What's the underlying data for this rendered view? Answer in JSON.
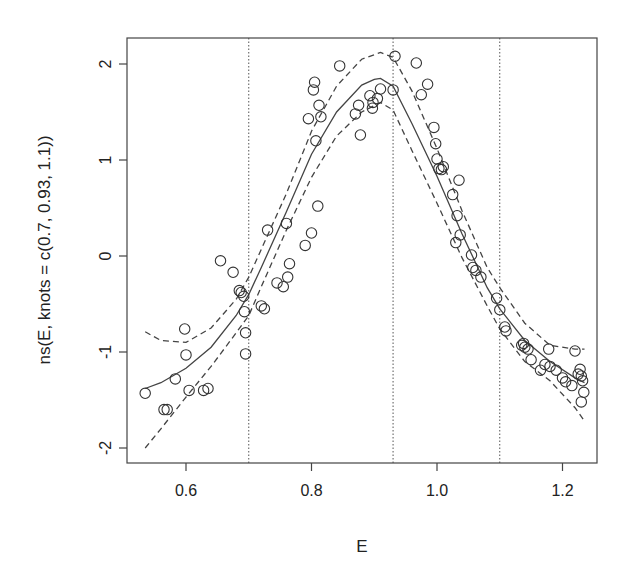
{
  "chart_data": {
    "type": "scatter",
    "title": "",
    "xlabel": "E",
    "ylabel": "ns(E, knots = c(0.7, 0.93, 1.1))",
    "xlim": [
      0.53,
      1.25
    ],
    "ylim": [
      -2.15,
      2.25
    ],
    "x_ticks": [
      0.6,
      0.8,
      1.0,
      1.2
    ],
    "x_tick_labels": [
      "0.6",
      "0.8",
      "1.0",
      "1.2"
    ],
    "y_ticks": [
      -2,
      -1,
      0,
      1,
      2
    ],
    "y_tick_labels": [
      "-2",
      "-1",
      "0",
      "1",
      "2"
    ],
    "grid": false,
    "legend": null,
    "knots": [
      0.7,
      0.93,
      1.1
    ],
    "series": [
      {
        "name": "partial residuals",
        "style": "open-circle",
        "points": [
          [
            0.535,
            -1.43
          ],
          [
            0.565,
            -1.6
          ],
          [
            0.57,
            -1.6
          ],
          [
            0.583,
            -1.28
          ],
          [
            0.598,
            -0.76
          ],
          [
            0.6,
            -1.03
          ],
          [
            0.605,
            -1.4
          ],
          [
            0.628,
            -1.4
          ],
          [
            0.635,
            -1.38
          ],
          [
            0.655,
            -0.05
          ],
          [
            0.675,
            -0.17
          ],
          [
            0.685,
            -0.36
          ],
          [
            0.688,
            -0.38
          ],
          [
            0.692,
            -0.42
          ],
          [
            0.693,
            -0.58
          ],
          [
            0.695,
            -0.8
          ],
          [
            0.695,
            -1.02
          ],
          [
            0.72,
            -0.52
          ],
          [
            0.725,
            -0.55
          ],
          [
            0.73,
            0.27
          ],
          [
            0.745,
            -0.28
          ],
          [
            0.755,
            -0.32
          ],
          [
            0.76,
            0.34
          ],
          [
            0.762,
            -0.22
          ],
          [
            0.765,
            -0.08
          ],
          [
            0.79,
            0.11
          ],
          [
            0.795,
            1.43
          ],
          [
            0.8,
            0.24
          ],
          [
            0.803,
            1.73
          ],
          [
            0.805,
            1.81
          ],
          [
            0.807,
            1.2
          ],
          [
            0.81,
            0.52
          ],
          [
            0.812,
            1.57
          ],
          [
            0.815,
            1.45
          ],
          [
            0.845,
            1.98
          ],
          [
            0.87,
            1.48
          ],
          [
            0.875,
            1.57
          ],
          [
            0.878,
            1.26
          ],
          [
            0.893,
            1.67
          ],
          [
            0.897,
            1.54
          ],
          [
            0.898,
            1.6
          ],
          [
            0.905,
            1.64
          ],
          [
            0.91,
            1.74
          ],
          [
            0.93,
            1.73
          ],
          [
            0.933,
            2.08
          ],
          [
            0.967,
            2.01
          ],
          [
            0.975,
            1.68
          ],
          [
            0.985,
            1.79
          ],
          [
            0.995,
            1.34
          ],
          [
            0.998,
            1.17
          ],
          [
            1.0,
            1.01
          ],
          [
            1.003,
            0.91
          ],
          [
            1.007,
            0.9
          ],
          [
            1.01,
            0.93
          ],
          [
            1.025,
            0.64
          ],
          [
            1.03,
            0.14
          ],
          [
            1.032,
            0.42
          ],
          [
            1.035,
            0.79
          ],
          [
            1.037,
            0.22
          ],
          [
            1.055,
            0.01
          ],
          [
            1.057,
            -0.12
          ],
          [
            1.062,
            -0.15
          ],
          [
            1.07,
            -0.22
          ],
          [
            1.095,
            -0.44
          ],
          [
            1.1,
            -0.56
          ],
          [
            1.108,
            -0.74
          ],
          [
            1.11,
            -0.78
          ],
          [
            1.135,
            -0.93
          ],
          [
            1.138,
            -0.91
          ],
          [
            1.14,
            -0.95
          ],
          [
            1.145,
            -0.97
          ],
          [
            1.15,
            -1.08
          ],
          [
            1.165,
            -1.19
          ],
          [
            1.172,
            -1.13
          ],
          [
            1.178,
            -0.97
          ],
          [
            1.18,
            -1.15
          ],
          [
            1.19,
            -1.19
          ],
          [
            1.2,
            -1.27
          ],
          [
            1.205,
            -1.31
          ],
          [
            1.215,
            -1.35
          ],
          [
            1.22,
            -0.99
          ],
          [
            1.225,
            -1.23
          ],
          [
            1.228,
            -1.18
          ],
          [
            1.23,
            -1.25
          ],
          [
            1.232,
            -1.3
          ],
          [
            1.234,
            -1.42
          ],
          [
            1.23,
            -1.52
          ]
        ]
      },
      {
        "name": "fitted spline",
        "style": "solid-line",
        "x": [
          0.535,
          0.56,
          0.6,
          0.64,
          0.68,
          0.7,
          0.72,
          0.76,
          0.8,
          0.84,
          0.88,
          0.9,
          0.91,
          0.93,
          0.96,
          1.0,
          1.04,
          1.08,
          1.1,
          1.14,
          1.18,
          1.22,
          1.235
        ],
        "y": [
          -1.38,
          -1.32,
          -1.17,
          -0.95,
          -0.62,
          -0.4,
          -0.12,
          0.46,
          1.06,
          1.5,
          1.78,
          1.84,
          1.85,
          1.77,
          1.38,
          0.83,
          0.23,
          -0.33,
          -0.55,
          -0.88,
          -1.1,
          -1.27,
          -1.32
        ]
      },
      {
        "name": "upper confidence band",
        "style": "dashed-line",
        "x": [
          0.535,
          0.56,
          0.6,
          0.64,
          0.68,
          0.7,
          0.72,
          0.76,
          0.8,
          0.84,
          0.88,
          0.91,
          0.93,
          0.96,
          1.0,
          1.04,
          1.08,
          1.1,
          1.14,
          1.18,
          1.22,
          1.235
        ],
        "y": [
          -0.79,
          -0.88,
          -0.9,
          -0.75,
          -0.45,
          -0.22,
          0.07,
          0.65,
          1.3,
          1.77,
          2.05,
          2.12,
          2.07,
          1.72,
          1.12,
          0.47,
          -0.12,
          -0.33,
          -0.7,
          -0.93,
          -0.97,
          -0.97
        ]
      },
      {
        "name": "lower confidence band",
        "style": "dashed-line",
        "x": [
          0.535,
          0.56,
          0.6,
          0.64,
          0.68,
          0.7,
          0.72,
          0.76,
          0.8,
          0.84,
          0.88,
          0.91,
          0.93,
          0.96,
          1.0,
          1.04,
          1.08,
          1.1,
          1.14,
          1.18,
          1.22,
          1.235
        ],
        "y": [
          -2.0,
          -1.8,
          -1.47,
          -1.15,
          -0.8,
          -0.62,
          -0.32,
          0.27,
          0.82,
          1.25,
          1.5,
          1.6,
          1.52,
          1.1,
          0.55,
          -0.02,
          -0.52,
          -0.76,
          -1.1,
          -1.3,
          -1.58,
          -1.72
        ]
      }
    ]
  }
}
